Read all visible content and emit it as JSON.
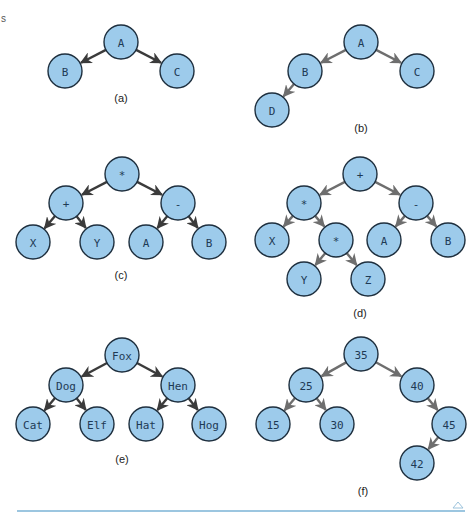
{
  "page_mark": "s",
  "style": {
    "node_fill": "#9dcbeb",
    "node_stroke": "#1e2f3e",
    "edge_dark": "#3b3b3b",
    "edge_gray": "#6e6e6e",
    "rule_color": "#7bb3d6",
    "node_radius": 17
  },
  "trees": [
    {
      "id": "a",
      "caption": "(a)",
      "caption_pos": [
        121,
        98
      ],
      "edge_color": "dark",
      "nodes": [
        {
          "id": "A",
          "label": "A",
          "x": 121,
          "y": 42
        },
        {
          "id": "B",
          "label": "B",
          "x": 65,
          "y": 71
        },
        {
          "id": "C",
          "label": "C",
          "x": 177,
          "y": 71
        }
      ],
      "edges": [
        [
          "A",
          "B"
        ],
        [
          "A",
          "C"
        ]
      ]
    },
    {
      "id": "b",
      "caption": "(b)",
      "caption_pos": [
        361,
        128
      ],
      "edge_color": "gray",
      "nodes": [
        {
          "id": "A",
          "label": "A",
          "x": 361,
          "y": 42
        },
        {
          "id": "B",
          "label": "B",
          "x": 305,
          "y": 71
        },
        {
          "id": "C",
          "label": "C",
          "x": 417,
          "y": 71
        },
        {
          "id": "D",
          "label": "D",
          "x": 272,
          "y": 110
        }
      ],
      "edges": [
        [
          "A",
          "B"
        ],
        [
          "A",
          "C"
        ],
        [
          "B",
          "D"
        ]
      ]
    },
    {
      "id": "c",
      "caption": "(c)",
      "caption_pos": [
        121,
        275
      ],
      "edge_color": "dark",
      "nodes": [
        {
          "id": "mul",
          "label": "*",
          "x": 122,
          "y": 174
        },
        {
          "id": "plus",
          "label": "+",
          "x": 66,
          "y": 203
        },
        {
          "id": "minus",
          "label": "-",
          "x": 178,
          "y": 203
        },
        {
          "id": "X",
          "label": "X",
          "x": 33,
          "y": 242
        },
        {
          "id": "Y",
          "label": "Y",
          "x": 97,
          "y": 242
        },
        {
          "id": "A",
          "label": "A",
          "x": 146,
          "y": 242
        },
        {
          "id": "B",
          "label": "B",
          "x": 209,
          "y": 242
        }
      ],
      "edges": [
        [
          "mul",
          "plus"
        ],
        [
          "mul",
          "minus"
        ],
        [
          "plus",
          "X"
        ],
        [
          "plus",
          "Y"
        ],
        [
          "minus",
          "A"
        ],
        [
          "minus",
          "B"
        ]
      ]
    },
    {
      "id": "d",
      "caption": "(d)",
      "caption_pos": [
        360,
        313
      ],
      "edge_color": "gray",
      "nodes": [
        {
          "id": "plus",
          "label": "+",
          "x": 360,
          "y": 174
        },
        {
          "id": "mul1",
          "label": "*",
          "x": 304,
          "y": 203
        },
        {
          "id": "minus",
          "label": "-",
          "x": 416,
          "y": 203
        },
        {
          "id": "X",
          "label": "X",
          "x": 272,
          "y": 240
        },
        {
          "id": "mul2",
          "label": "*",
          "x": 336,
          "y": 240
        },
        {
          "id": "A",
          "label": "A",
          "x": 384,
          "y": 240
        },
        {
          "id": "B",
          "label": "B",
          "x": 448,
          "y": 240
        },
        {
          "id": "Y",
          "label": "Y",
          "x": 304,
          "y": 279
        },
        {
          "id": "Z",
          "label": "Z",
          "x": 368,
          "y": 279
        }
      ],
      "edges": [
        [
          "plus",
          "mul1"
        ],
        [
          "plus",
          "minus"
        ],
        [
          "mul1",
          "X"
        ],
        [
          "mul1",
          "mul2"
        ],
        [
          "minus",
          "A"
        ],
        [
          "minus",
          "B"
        ],
        [
          "mul2",
          "Y"
        ],
        [
          "mul2",
          "Z"
        ]
      ]
    },
    {
      "id": "e",
      "caption": "(e)",
      "caption_pos": [
        122,
        459
      ],
      "edge_color": "dark",
      "nodes": [
        {
          "id": "Fox",
          "label": "Fox",
          "x": 122,
          "y": 355
        },
        {
          "id": "Dog",
          "label": "Dog",
          "x": 66,
          "y": 385
        },
        {
          "id": "Hen",
          "label": "Hen",
          "x": 178,
          "y": 385
        },
        {
          "id": "Cat",
          "label": "Cat",
          "x": 33,
          "y": 424
        },
        {
          "id": "Elf",
          "label": "Elf",
          "x": 97,
          "y": 424
        },
        {
          "id": "Hat",
          "label": "Hat",
          "x": 146,
          "y": 424
        },
        {
          "id": "Hog",
          "label": "Hog",
          "x": 209,
          "y": 424
        }
      ],
      "edges": [
        [
          "Fox",
          "Dog"
        ],
        [
          "Fox",
          "Hen"
        ],
        [
          "Dog",
          "Cat"
        ],
        [
          "Dog",
          "Elf"
        ],
        [
          "Hen",
          "Hat"
        ],
        [
          "Hen",
          "Hog"
        ]
      ]
    },
    {
      "id": "f",
      "caption": "(f)",
      "caption_pos": [
        363,
        491
      ],
      "edge_color": "gray",
      "nodes": [
        {
          "id": "n35",
          "label": "35",
          "x": 361,
          "y": 354
        },
        {
          "id": "n25",
          "label": "25",
          "x": 306,
          "y": 385
        },
        {
          "id": "n40",
          "label": "40",
          "x": 417,
          "y": 385
        },
        {
          "id": "n15",
          "label": "15",
          "x": 273,
          "y": 424
        },
        {
          "id": "n30",
          "label": "30",
          "x": 337,
          "y": 424
        },
        {
          "id": "n45",
          "label": "45",
          "x": 449,
          "y": 424
        },
        {
          "id": "n42",
          "label": "42",
          "x": 417,
          "y": 463
        }
      ],
      "edges": [
        [
          "n35",
          "n25"
        ],
        [
          "n35",
          "n40"
        ],
        [
          "n25",
          "n15"
        ],
        [
          "n25",
          "n30"
        ],
        [
          "n40",
          "n45"
        ],
        [
          "n45",
          "n42"
        ]
      ]
    }
  ],
  "footer": {
    "rule": {
      "x1": 17,
      "x2": 465,
      "y": 511
    },
    "marker_icon": "up-triangle-outline",
    "marker_pos": [
      458,
      505
    ]
  }
}
